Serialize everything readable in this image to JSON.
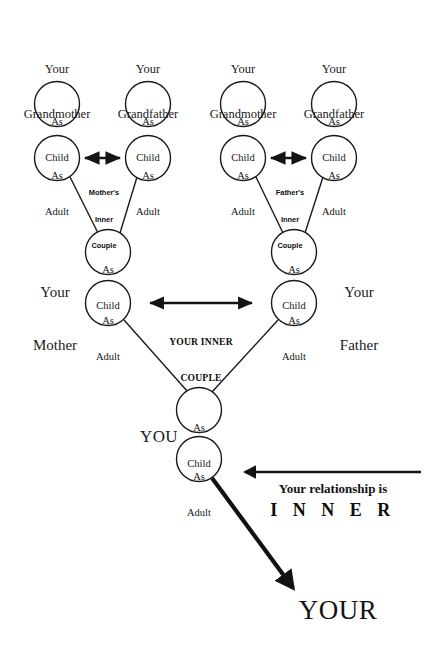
{
  "diagram": {
    "node_labels": {
      "as_child_line1": "As",
      "as_child_line2": "Child",
      "as_adult_line1": "As",
      "as_adult_line2": "Adult"
    },
    "grandparents": [
      {
        "id": "maternal-grandmother",
        "title_line1": "Your",
        "title_line2": "Grandmother"
      },
      {
        "id": "maternal-grandfather",
        "title_line1": "Your",
        "title_line2": "Grandfather"
      },
      {
        "id": "paternal-grandmother",
        "title_line1": "Your",
        "title_line2": "Grandmother"
      },
      {
        "id": "paternal-grandfather",
        "title_line1": "Your",
        "title_line2": "Grandfather"
      }
    ],
    "parents": [
      {
        "id": "mother",
        "title_line1": "Your",
        "title_line2": "Mother"
      },
      {
        "id": "father",
        "title_line1": "Your",
        "title_line2": "Father"
      }
    ],
    "inner_couples": {
      "mothers": {
        "line1": "Mother's",
        "line2": "Inner",
        "line3": "Couple"
      },
      "fathers": {
        "line1": "Father's",
        "line2": "Inner",
        "line3": "Couple"
      },
      "yours": {
        "line1": "YOUR INNER",
        "line2": "COUPLE"
      }
    },
    "you": {
      "label": "YOU"
    },
    "relationship": {
      "line1": "Your relationship is",
      "line2": "I N N E R"
    },
    "outcome": {
      "label": "YOUR"
    },
    "colors": {
      "ink": "#141414",
      "background": "#ffffff",
      "circle_fill": "#ffffff"
    }
  }
}
